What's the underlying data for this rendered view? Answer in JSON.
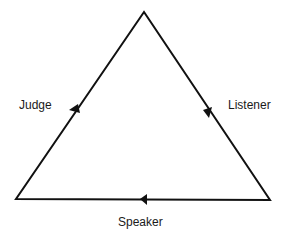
{
  "diagram": {
    "type": "cycle-triangle",
    "nodes": [
      {
        "id": "judge",
        "label": "Judge"
      },
      {
        "id": "listener",
        "label": "Listener"
      },
      {
        "id": "speaker",
        "label": "Speaker"
      }
    ],
    "edges": [
      {
        "side": "left",
        "direction": "up"
      },
      {
        "side": "right",
        "direction": "down"
      },
      {
        "side": "bottom",
        "direction": "left"
      }
    ],
    "colors": {
      "line": "#111111",
      "text": "#1a1a1a",
      "background": "#ffffff"
    }
  }
}
